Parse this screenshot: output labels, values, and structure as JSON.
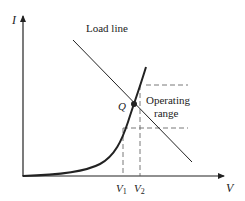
{
  "diagram": {
    "type": "diode I-V characteristic with load line",
    "axes": {
      "y_label": "I",
      "x_label": "V"
    },
    "labels": {
      "load_line": "Load line",
      "q_point": "Q",
      "operating_range_line1": "Operating",
      "operating_range_line2": "range",
      "v1_main": "V",
      "v1_sub": "1",
      "v2_main": "V",
      "v2_sub": "2"
    },
    "colors": {
      "ink": "#222222",
      "dash": "#555555",
      "background": "#ffffff"
    }
  }
}
